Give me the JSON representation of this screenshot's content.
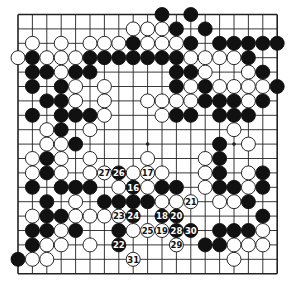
{
  "board": {
    "size": 19,
    "origin_x": 18,
    "origin_y": 14.5,
    "spacing": 14.4,
    "stone_radius": 7,
    "line_color": "#222222",
    "black_color": "#111111",
    "white_color": "#ffffff",
    "hoshi": [
      [
        3,
        3
      ],
      [
        3,
        9
      ],
      [
        3,
        15
      ],
      [
        9,
        3
      ],
      [
        9,
        9
      ],
      [
        9,
        15
      ],
      [
        15,
        3
      ],
      [
        15,
        9
      ],
      [
        15,
        15
      ]
    ],
    "stones": [
      {
        "r": 0,
        "c": 10,
        "color": "B"
      },
      {
        "r": 0,
        "c": 12,
        "color": "B"
      },
      {
        "r": 1,
        "c": 8,
        "color": "W"
      },
      {
        "r": 1,
        "c": 9,
        "color": "W"
      },
      {
        "r": 1,
        "c": 10,
        "color": "W"
      },
      {
        "r": 1,
        "c": 11,
        "color": "B"
      },
      {
        "r": 1,
        "c": 13,
        "color": "B"
      },
      {
        "r": 2,
        "c": 1,
        "color": "W"
      },
      {
        "r": 2,
        "c": 3,
        "color": "W"
      },
      {
        "r": 2,
        "c": 5,
        "color": "W"
      },
      {
        "r": 2,
        "c": 6,
        "color": "W"
      },
      {
        "r": 2,
        "c": 7,
        "color": "W"
      },
      {
        "r": 2,
        "c": 8,
        "color": "B"
      },
      {
        "r": 2,
        "c": 9,
        "color": "W"
      },
      {
        "r": 2,
        "c": 10,
        "color": "W"
      },
      {
        "r": 2,
        "c": 11,
        "color": "W"
      },
      {
        "r": 2,
        "c": 12,
        "color": "B"
      },
      {
        "r": 2,
        "c": 14,
        "color": "B"
      },
      {
        "r": 2,
        "c": 15,
        "color": "B"
      },
      {
        "r": 2,
        "c": 16,
        "color": "B"
      },
      {
        "r": 2,
        "c": 17,
        "color": "B"
      },
      {
        "r": 2,
        "c": 18,
        "color": "B"
      },
      {
        "r": 3,
        "c": 0,
        "color": "W"
      },
      {
        "r": 3,
        "c": 1,
        "color": "B"
      },
      {
        "r": 3,
        "c": 2,
        "color": "W"
      },
      {
        "r": 3,
        "c": 3,
        "color": "W"
      },
      {
        "r": 3,
        "c": 4,
        "color": "W"
      },
      {
        "r": 3,
        "c": 5,
        "color": "B"
      },
      {
        "r": 3,
        "c": 6,
        "color": "B"
      },
      {
        "r": 3,
        "c": 7,
        "color": "B"
      },
      {
        "r": 3,
        "c": 8,
        "color": "B"
      },
      {
        "r": 3,
        "c": 9,
        "color": "B"
      },
      {
        "r": 3,
        "c": 10,
        "color": "B"
      },
      {
        "r": 3,
        "c": 11,
        "color": "B"
      },
      {
        "r": 3,
        "c": 12,
        "color": "W"
      },
      {
        "r": 3,
        "c": 13,
        "color": "W"
      },
      {
        "r": 3,
        "c": 14,
        "color": "W"
      },
      {
        "r": 3,
        "c": 15,
        "color": "W"
      },
      {
        "r": 3,
        "c": 16,
        "color": "B"
      },
      {
        "r": 4,
        "c": 1,
        "color": "B"
      },
      {
        "r": 4,
        "c": 2,
        "color": "B"
      },
      {
        "r": 4,
        "c": 3,
        "color": "W"
      },
      {
        "r": 4,
        "c": 4,
        "color": "B"
      },
      {
        "r": 4,
        "c": 5,
        "color": "B"
      },
      {
        "r": 4,
        "c": 11,
        "color": "B"
      },
      {
        "r": 4,
        "c": 12,
        "color": "B"
      },
      {
        "r": 4,
        "c": 13,
        "color": "W"
      },
      {
        "r": 4,
        "c": 16,
        "color": "W"
      },
      {
        "r": 4,
        "c": 17,
        "color": "B"
      },
      {
        "r": 5,
        "c": 1,
        "color": "B"
      },
      {
        "r": 5,
        "c": 3,
        "color": "B"
      },
      {
        "r": 5,
        "c": 4,
        "color": "W"
      },
      {
        "r": 5,
        "c": 6,
        "color": "W"
      },
      {
        "r": 5,
        "c": 11,
        "color": "B"
      },
      {
        "r": 5,
        "c": 12,
        "color": "W"
      },
      {
        "r": 5,
        "c": 13,
        "color": "B"
      },
      {
        "r": 5,
        "c": 14,
        "color": "W"
      },
      {
        "r": 5,
        "c": 15,
        "color": "W"
      },
      {
        "r": 5,
        "c": 16,
        "color": "W"
      },
      {
        "r": 5,
        "c": 17,
        "color": "W"
      },
      {
        "r": 5,
        "c": 18,
        "color": "B"
      },
      {
        "r": 6,
        "c": 2,
        "color": "B"
      },
      {
        "r": 6,
        "c": 3,
        "color": "B"
      },
      {
        "r": 6,
        "c": 4,
        "color": "W"
      },
      {
        "r": 6,
        "c": 6,
        "color": "W"
      },
      {
        "r": 6,
        "c": 9,
        "color": "W"
      },
      {
        "r": 6,
        "c": 10,
        "color": "W"
      },
      {
        "r": 6,
        "c": 11,
        "color": "W"
      },
      {
        "r": 6,
        "c": 12,
        "color": "W"
      },
      {
        "r": 6,
        "c": 13,
        "color": "B"
      },
      {
        "r": 6,
        "c": 14,
        "color": "B"
      },
      {
        "r": 6,
        "c": 15,
        "color": "B"
      },
      {
        "r": 6,
        "c": 16,
        "color": "W"
      },
      {
        "r": 6,
        "c": 17,
        "color": "B"
      },
      {
        "r": 7,
        "c": 1,
        "color": "B"
      },
      {
        "r": 7,
        "c": 3,
        "color": "B"
      },
      {
        "r": 7,
        "c": 4,
        "color": "B"
      },
      {
        "r": 7,
        "c": 5,
        "color": "B"
      },
      {
        "r": 7,
        "c": 6,
        "color": "W"
      },
      {
        "r": 7,
        "c": 10,
        "color": "W"
      },
      {
        "r": 7,
        "c": 11,
        "color": "B"
      },
      {
        "r": 7,
        "c": 12,
        "color": "B"
      },
      {
        "r": 7,
        "c": 14,
        "color": "B"
      },
      {
        "r": 7,
        "c": 15,
        "color": "B"
      },
      {
        "r": 7,
        "c": 16,
        "color": "B"
      },
      {
        "r": 8,
        "c": 2,
        "color": "W"
      },
      {
        "r": 8,
        "c": 3,
        "color": "B"
      },
      {
        "r": 8,
        "c": 5,
        "color": "W"
      },
      {
        "r": 8,
        "c": 15,
        "color": "W"
      },
      {
        "r": 9,
        "c": 2,
        "color": "W"
      },
      {
        "r": 9,
        "c": 3,
        "color": "W"
      },
      {
        "r": 9,
        "c": 4,
        "color": "B"
      },
      {
        "r": 9,
        "c": 14,
        "color": "B"
      },
      {
        "r": 9,
        "c": 16,
        "color": "W"
      },
      {
        "r": 10,
        "c": 1,
        "color": "W"
      },
      {
        "r": 10,
        "c": 2,
        "color": "B"
      },
      {
        "r": 10,
        "c": 3,
        "color": "W"
      },
      {
        "r": 10,
        "c": 5,
        "color": "W"
      },
      {
        "r": 10,
        "c": 9,
        "color": "W"
      },
      {
        "r": 10,
        "c": 13,
        "color": "W"
      },
      {
        "r": 10,
        "c": 14,
        "color": "B"
      },
      {
        "r": 11,
        "c": 1,
        "color": "W"
      },
      {
        "r": 11,
        "c": 2,
        "color": "B"
      },
      {
        "r": 11,
        "c": 3,
        "color": "W"
      },
      {
        "r": 11,
        "c": 5,
        "color": "W"
      },
      {
        "r": 11,
        "c": 6,
        "color": "W",
        "label": "27"
      },
      {
        "r": 11,
        "c": 7,
        "color": "B",
        "label": "26"
      },
      {
        "r": 11,
        "c": 8,
        "color": "W"
      },
      {
        "r": 11,
        "c": 9,
        "color": "W",
        "label": "17"
      },
      {
        "r": 11,
        "c": 10,
        "color": "W"
      },
      {
        "r": 11,
        "c": 13,
        "color": "W"
      },
      {
        "r": 11,
        "c": 14,
        "color": "B"
      },
      {
        "r": 11,
        "c": 16,
        "color": "W"
      },
      {
        "r": 11,
        "c": 17,
        "color": "B"
      },
      {
        "r": 12,
        "c": 1,
        "color": "B"
      },
      {
        "r": 12,
        "c": 3,
        "color": "B"
      },
      {
        "r": 12,
        "c": 4,
        "color": "B"
      },
      {
        "r": 12,
        "c": 5,
        "color": "B"
      },
      {
        "r": 12,
        "c": 7,
        "color": "W"
      },
      {
        "r": 12,
        "c": 8,
        "color": "B",
        "label": "16"
      },
      {
        "r": 12,
        "c": 9,
        "color": "W"
      },
      {
        "r": 12,
        "c": 10,
        "color": "B"
      },
      {
        "r": 12,
        "c": 11,
        "color": "B"
      },
      {
        "r": 12,
        "c": 13,
        "color": "W"
      },
      {
        "r": 12,
        "c": 14,
        "color": "B"
      },
      {
        "r": 12,
        "c": 15,
        "color": "B"
      },
      {
        "r": 12,
        "c": 16,
        "color": "W"
      },
      {
        "r": 12,
        "c": 17,
        "color": "B"
      },
      {
        "r": 13,
        "c": 2,
        "color": "B"
      },
      {
        "r": 13,
        "c": 4,
        "color": "W"
      },
      {
        "r": 13,
        "c": 6,
        "color": "B"
      },
      {
        "r": 13,
        "c": 7,
        "color": "B"
      },
      {
        "r": 13,
        "c": 8,
        "color": "B"
      },
      {
        "r": 13,
        "c": 9,
        "color": "B"
      },
      {
        "r": 13,
        "c": 10,
        "color": "W"
      },
      {
        "r": 13,
        "c": 11,
        "color": "W"
      },
      {
        "r": 13,
        "c": 12,
        "color": "W",
        "label": "21"
      },
      {
        "r": 13,
        "c": 14,
        "color": "W"
      },
      {
        "r": 13,
        "c": 15,
        "color": "W"
      },
      {
        "r": 13,
        "c": 16,
        "color": "B"
      },
      {
        "r": 14,
        "c": 1,
        "color": "W"
      },
      {
        "r": 14,
        "c": 2,
        "color": "B"
      },
      {
        "r": 14,
        "c": 3,
        "color": "B"
      },
      {
        "r": 14,
        "c": 4,
        "color": "W"
      },
      {
        "r": 14,
        "c": 5,
        "color": "W"
      },
      {
        "r": 14,
        "c": 6,
        "color": "W"
      },
      {
        "r": 14,
        "c": 7,
        "color": "W",
        "label": "23"
      },
      {
        "r": 14,
        "c": 8,
        "color": "B",
        "label": "24"
      },
      {
        "r": 14,
        "c": 10,
        "color": "B",
        "label": "18"
      },
      {
        "r": 14,
        "c": 11,
        "color": "B",
        "label": "20"
      },
      {
        "r": 14,
        "c": 17,
        "color": "B"
      },
      {
        "r": 15,
        "c": 1,
        "color": "B"
      },
      {
        "r": 15,
        "c": 2,
        "color": "B"
      },
      {
        "r": 15,
        "c": 3,
        "color": "W"
      },
      {
        "r": 15,
        "c": 4,
        "color": "B"
      },
      {
        "r": 15,
        "c": 7,
        "color": "B"
      },
      {
        "r": 15,
        "c": 8,
        "color": "W"
      },
      {
        "r": 15,
        "c": 9,
        "color": "W",
        "label": "25"
      },
      {
        "r": 15,
        "c": 10,
        "color": "W",
        "label": "19"
      },
      {
        "r": 15,
        "c": 11,
        "color": "B",
        "label": "28"
      },
      {
        "r": 15,
        "c": 12,
        "color": "B",
        "label": "30"
      },
      {
        "r": 15,
        "c": 14,
        "color": "B"
      },
      {
        "r": 15,
        "c": 15,
        "color": "B"
      },
      {
        "r": 15,
        "c": 16,
        "color": "B"
      },
      {
        "r": 15,
        "c": 17,
        "color": "W"
      },
      {
        "r": 16,
        "c": 1,
        "color": "B"
      },
      {
        "r": 16,
        "c": 2,
        "color": "W"
      },
      {
        "r": 16,
        "c": 3,
        "color": "W"
      },
      {
        "r": 16,
        "c": 5,
        "color": "W"
      },
      {
        "r": 16,
        "c": 7,
        "color": "B",
        "label": "22"
      },
      {
        "r": 16,
        "c": 11,
        "color": "W",
        "label": "29"
      },
      {
        "r": 16,
        "c": 13,
        "color": "B"
      },
      {
        "r": 16,
        "c": 14,
        "color": "B"
      },
      {
        "r": 16,
        "c": 15,
        "color": "W"
      },
      {
        "r": 16,
        "c": 16,
        "color": "W"
      },
      {
        "r": 16,
        "c": 17,
        "color": "W"
      },
      {
        "r": 17,
        "c": 0,
        "color": "B"
      },
      {
        "r": 17,
        "c": 1,
        "color": "W"
      },
      {
        "r": 17,
        "c": 2,
        "color": "W"
      },
      {
        "r": 17,
        "c": 8,
        "color": "W",
        "label": "31"
      },
      {
        "r": 17,
        "c": 15,
        "color": "W"
      }
    ]
  }
}
